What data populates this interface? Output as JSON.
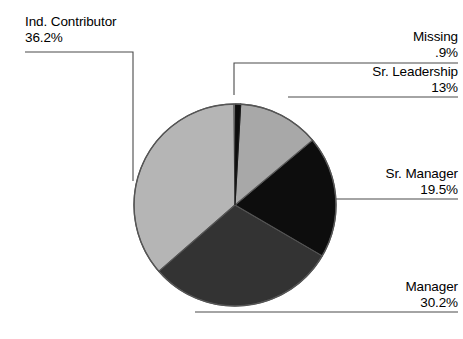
{
  "chart_data": {
    "type": "pie",
    "title": "",
    "xlabel": "",
    "ylabel": "",
    "legend_position": "none",
    "grid": false,
    "label_format": "category name above percentage",
    "start_angle_deg": 0,
    "direction": "clockwise",
    "categories": [
      "Missing",
      "Sr. Leadership",
      "Sr. Manager",
      "Manager",
      "Ind. Contributor"
    ],
    "values": [
      0.9,
      13,
      19.5,
      30.2,
      36.2
    ],
    "value_labels": [
      ".9%",
      "13%",
      "19.5%",
      "30.2%",
      "36.2%"
    ],
    "units": "percent",
    "colors": [
      "#0d0d0d",
      "#a8a8a8",
      "#0d0d0d",
      "#333333",
      "#b5b5b5"
    ],
    "slices": [
      {
        "name": "Missing",
        "value": 0.9,
        "value_label": ".9%",
        "color": "#0d0d0d",
        "start_deg": 0.0,
        "end_deg": 3.24
      },
      {
        "name": "Sr. Leadership",
        "value": 13,
        "value_label": "13%",
        "color": "#a8a8a8",
        "start_deg": 3.24,
        "end_deg": 50.04
      },
      {
        "name": "Sr. Manager",
        "value": 19.5,
        "value_label": "19.5%",
        "color": "#0d0d0d",
        "start_deg": 50.04,
        "end_deg": 120.24
      },
      {
        "name": "Manager",
        "value": 30.2,
        "value_label": "30.2%",
        "color": "#333333",
        "start_deg": 120.24,
        "end_deg": 228.96
      },
      {
        "name": "Ind. Contributor",
        "value": 36.2,
        "value_label": "36.2%",
        "color": "#b5b5b5",
        "start_deg": 228.96,
        "end_deg": 359.28
      }
    ]
  },
  "labels": {
    "ind_contributor": {
      "name": "Ind. Contributor",
      "value": "36.2%"
    },
    "missing": {
      "name": "Missing",
      "value": ".9%"
    },
    "sr_leadership": {
      "name": "Sr. Leadership",
      "value": "13%"
    },
    "sr_manager": {
      "name": "Sr. Manager",
      "value": "19.5%"
    },
    "manager": {
      "name": "Manager",
      "value": "30.2%"
    }
  },
  "style": {
    "background": "#ffffff",
    "outline": "#555555",
    "leader_line": "#4a4a4a",
    "text": "#000000"
  }
}
